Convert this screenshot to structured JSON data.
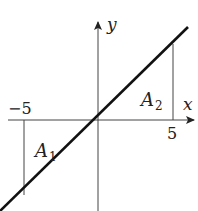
{
  "diagram": {
    "type": "graph-of-line",
    "axes": {
      "x_label": "x",
      "y_label": "y"
    },
    "ticks": {
      "neg": "−5",
      "pos": "5"
    },
    "regions": [
      {
        "name": "A",
        "sub": "1"
      },
      {
        "name": "A",
        "sub": "2"
      }
    ],
    "line": {
      "equation": "y = x",
      "x_range": [
        -5,
        5
      ]
    },
    "colors": {
      "line": "#111111",
      "axis": "#444444",
      "text": "#222222"
    }
  }
}
